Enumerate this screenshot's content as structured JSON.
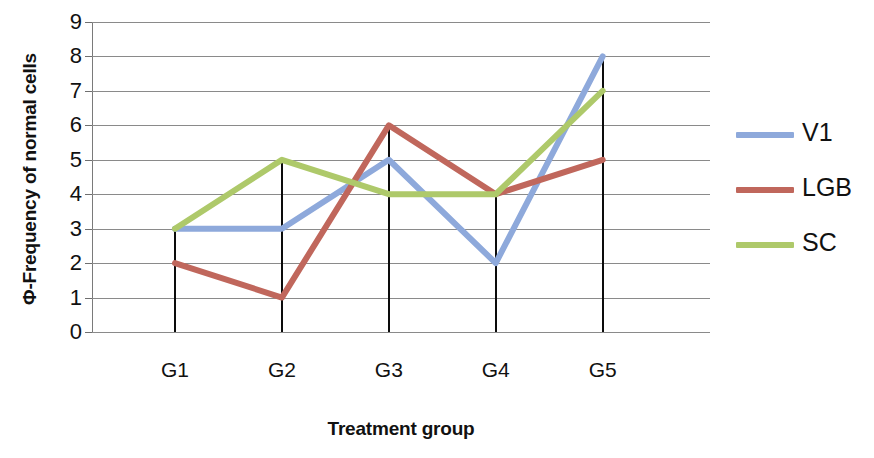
{
  "chart_data": {
    "type": "line",
    "title": "",
    "xlabel": "Treatment group",
    "ylabel": "Φ-Frequency of normal cells",
    "categories": [
      "G1",
      "G2",
      "G3",
      "G4",
      "G5"
    ],
    "ylim": [
      0,
      9
    ],
    "ytick_labels": [
      "0",
      "1",
      "2",
      "3",
      "4",
      "5",
      "6",
      "7",
      "8",
      "9"
    ],
    "grid": true,
    "legend_position": "right",
    "series": [
      {
        "name": "V1",
        "values": [
          3,
          3,
          5,
          2,
          8
        ],
        "color": "#8ea9db"
      },
      {
        "name": "LGB",
        "values": [
          2,
          1,
          6,
          4,
          5
        ],
        "color": "#c0675c"
      },
      {
        "name": "SC",
        "values": [
          3,
          5,
          4,
          4,
          7
        ],
        "color": "#a6c martedì"
      }
    ]
  },
  "axes": {
    "y_title": "Φ-Frequency of normal cells",
    "x_title": "Treatment group",
    "y_ticks": [
      "9",
      "8",
      "7",
      "6",
      "5",
      "4",
      "3",
      "2",
      "1",
      "0"
    ],
    "x_ticks": [
      "G1",
      "G2",
      "G3",
      "G4",
      "G5"
    ]
  },
  "legend": {
    "items": [
      {
        "label": "V1",
        "color": "#8ea9db"
      },
      {
        "label": "LGB",
        "color": "#c0675c"
      },
      {
        "label": "SC",
        "color": "#a9c royal"
      }
    ]
  },
  "colors": {
    "v1": "#8ea9db",
    "lgb": "#c0675c",
    "sc": "#aec96a",
    "gridline": "#8a8a8a",
    "droplines": "#0c0c0c",
    "text": "#111111",
    "background": "#ffffff"
  }
}
